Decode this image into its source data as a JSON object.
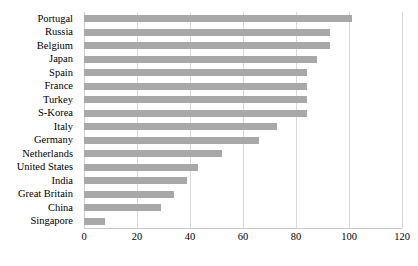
{
  "chart_data": {
    "type": "bar",
    "orientation": "horizontal",
    "title": "",
    "xlabel": "",
    "ylabel": "",
    "xlim": [
      0,
      120
    ],
    "xticks": [
      0,
      20,
      40,
      60,
      80,
      100,
      120
    ],
    "grid": true,
    "legend": false,
    "bar_color": "#a8a8a8",
    "gridline_color": "#d9d9d9",
    "categories": [
      "Portugal",
      "Russia",
      "Belgium",
      "Japan",
      "Spain",
      "France",
      "Turkey",
      "S-Korea",
      "Italy",
      "Germany",
      "Netherlands",
      "United States",
      "India",
      "Great Britain",
      "China",
      "Singapore"
    ],
    "values": [
      101,
      93,
      93,
      88,
      84,
      84,
      84,
      84,
      73,
      66,
      52,
      43,
      39,
      34,
      29,
      8
    ]
  }
}
